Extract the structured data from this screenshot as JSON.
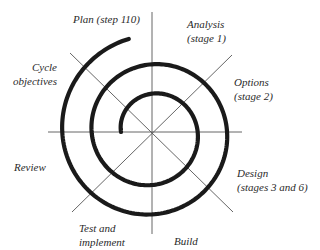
{
  "diagram": {
    "type": "spiral-model",
    "center": {
      "x": 152,
      "y": 132
    },
    "colors": {
      "spiral": "#1a1a1a",
      "axes": "#555555",
      "text": "#2a2a2a",
      "background": "#ffffff"
    },
    "spiral": {
      "start_radius": 31,
      "start_angle_deg": 180,
      "sweep_deg": 797,
      "growth_per_deg": 0.0816,
      "stroke_width": 4.2
    },
    "axes": [
      {
        "name": "vertical",
        "x1": 152,
        "y1": 12,
        "x2": 152,
        "y2": 234
      },
      {
        "name": "horizontal",
        "x1": 48,
        "y1": 132,
        "x2": 242,
        "y2": 132
      },
      {
        "name": "diagonal-down",
        "x1": 70,
        "y1": 53,
        "x2": 233,
        "y2": 212
      },
      {
        "name": "diagonal-up",
        "x1": 72,
        "y1": 212,
        "x2": 232,
        "y2": 55
      }
    ],
    "labels": {
      "plan": {
        "lines": [
          "Plan (step 110)"
        ]
      },
      "analysis": {
        "lines": [
          "Analysis",
          "(stage 1)"
        ]
      },
      "options": {
        "lines": [
          "Options",
          "(stage 2)"
        ]
      },
      "design": {
        "lines": [
          "Design",
          "(stages 3 and 6)"
        ]
      },
      "build": {
        "lines": [
          "Build"
        ]
      },
      "test": {
        "lines": [
          "Test and",
          "implement"
        ]
      },
      "review": {
        "lines": [
          "Review"
        ]
      },
      "cycle": {
        "lines": [
          "Cycle",
          "objectives"
        ]
      }
    }
  }
}
